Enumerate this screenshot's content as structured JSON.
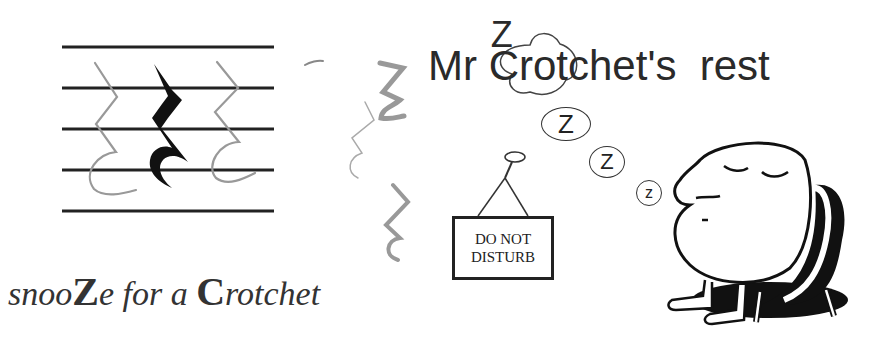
{
  "title": {
    "prefix": "Mr ",
    "bubble_letter": "Z",
    "cap_letter": "C",
    "rest": "rotchet's  rest"
  },
  "caption": {
    "part1": "snoo",
    "bold1": "Z",
    "part2": "e for a ",
    "bold2": "C",
    "part3": "rotchet"
  },
  "sign": {
    "line1": "DO NOT",
    "line2": "DISTURB"
  },
  "sleep_bubbles": [
    {
      "letter": "Z",
      "size": "large"
    },
    {
      "letter": "Z",
      "size": "medium"
    },
    {
      "letter": "z",
      "size": "small"
    }
  ],
  "illustrations": {
    "staff_lines": 5,
    "rest_symbol": "crotchet-rest",
    "character": "sleeping-blob-in-chair"
  }
}
